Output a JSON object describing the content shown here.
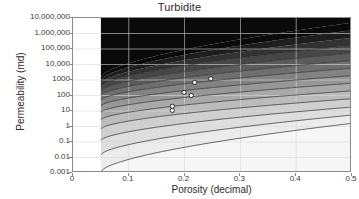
{
  "chart_data": {
    "type": "area",
    "title": "Turbidite",
    "xlabel": "Porosity (decimal)",
    "ylabel": "Permeability (md)",
    "xlim": [
      0,
      0.5
    ],
    "ylim": [
      0.001,
      10000000
    ],
    "yscale": "log",
    "xscale": "linear",
    "grid": true,
    "legend": "none",
    "xticks": [
      "0",
      "0.1",
      "0.2",
      "0.3",
      "0.4",
      "0.5"
    ],
    "xtick_values": [
      0,
      0.1,
      0.2,
      0.3,
      0.4,
      0.5
    ],
    "yticks": [
      "10,000,000",
      "1,000,000",
      "100,000",
      "10,000",
      "1000",
      "100",
      "10",
      "1",
      "0.1",
      "0.01",
      "0.001"
    ],
    "ytick_values": [
      10000000,
      1000000,
      100000,
      10000,
      1000,
      100,
      10,
      1,
      0.1,
      0.01,
      0.001
    ],
    "band_start_porosity": 0.05,
    "bands_note": "Greyscale permeability-porosity contour bands, darkest at top (highest permeability) grading to lightest at bottom; bands emerge at porosity 0.05 and fan upward to porosity 0.5.",
    "bands": [
      {
        "index": 1,
        "color": "#0a0a0a",
        "k_at_005": 1500,
        "k_at_050": 5000000
      },
      {
        "index": 2,
        "color": "#1e1e1e",
        "k_at_005": 1000,
        "k_at_050": 1600000
      },
      {
        "index": 3,
        "color": "#323232",
        "k_at_005": 620,
        "k_at_050": 520000
      },
      {
        "index": 4,
        "color": "#474747",
        "k_at_005": 380,
        "k_at_050": 170000
      },
      {
        "index": 5,
        "color": "#5b5b5b",
        "k_at_005": 200,
        "k_at_050": 56000
      },
      {
        "index": 6,
        "color": "#6f6f6f",
        "k_at_005": 105,
        "k_at_050": 18000
      },
      {
        "index": 7,
        "color": "#838383",
        "k_at_005": 52,
        "k_at_050": 5800
      },
      {
        "index": 8,
        "color": "#979797",
        "k_at_005": 22,
        "k_at_050": 1900
      },
      {
        "index": 9,
        "color": "#a9a9a9",
        "k_at_005": 8.5,
        "k_at_050": 620
      },
      {
        "index": 10,
        "color": "#bcbcbc",
        "k_at_005": 2.8,
        "k_at_050": 200
      },
      {
        "index": 11,
        "color": "#cfcfcf",
        "k_at_005": 0.72,
        "k_at_050": 62
      },
      {
        "index": 12,
        "color": "#dedede",
        "k_at_005": 0.13,
        "k_at_050": 18
      },
      {
        "index": 13,
        "color": "#ececec",
        "k_at_005": 0.015,
        "k_at_050": 5.5
      },
      {
        "index": 14,
        "color": "#f6f6f6",
        "k_at_005": 0.0012,
        "k_at_050": 1.6
      }
    ],
    "series": [
      {
        "name": "Core samples",
        "marker": "circle",
        "marker_face": "#ffffff",
        "marker_edge": "#1a1a1a",
        "points": [
          {
            "x": 0.178,
            "y": 20
          },
          {
            "x": 0.178,
            "y": 11
          },
          {
            "x": 0.199,
            "y": 160
          },
          {
            "x": 0.212,
            "y": 100
          },
          {
            "x": 0.218,
            "y": 700
          },
          {
            "x": 0.247,
            "y": 1200
          }
        ]
      }
    ],
    "colors": {
      "axis": "#8c8c8c",
      "grid": "#d9d9d9",
      "text": "#2b2b2b",
      "tick_text": "#3a3a3a",
      "plot_background": "#ffffff"
    }
  }
}
